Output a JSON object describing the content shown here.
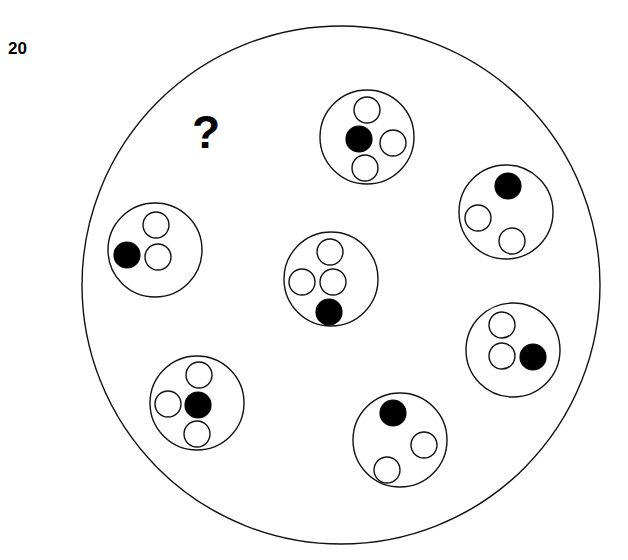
{
  "figure": {
    "item_number": "20",
    "query_symbol": "?",
    "background_color": "#ffffff",
    "stroke_color": "#111111",
    "filled_dot_color": "#000000",
    "open_dot_color": "#ffffff",
    "outer_boundary": {
      "cx": 341,
      "cy": 285,
      "r": 259
    },
    "item_number_position": {
      "x": 8,
      "y": 54
    },
    "query_position": {
      "x": 192,
      "y": 148
    },
    "group_radius": 47,
    "dot_radius": 13,
    "groups": [
      {
        "name": "top-group",
        "cx": 367,
        "cy": 137,
        "dot_count": 4,
        "filled_count": 1,
        "open_count": 3,
        "dots": [
          {
            "dx": 0,
            "dy": -27,
            "fill": "open"
          },
          {
            "dx": -8,
            "dy": 2,
            "fill": "filled"
          },
          {
            "dx": 26,
            "dy": 6,
            "fill": "open"
          },
          {
            "dx": -2,
            "dy": 31,
            "fill": "open"
          }
        ]
      },
      {
        "name": "upper-right-group",
        "cx": 506,
        "cy": 212,
        "dot_count": 3,
        "filled_count": 1,
        "open_count": 2,
        "dots": [
          {
            "dx": 2,
            "dy": -26,
            "fill": "filled"
          },
          {
            "dx": -28,
            "dy": 6,
            "fill": "open"
          },
          {
            "dx": 6,
            "dy": 29,
            "fill": "open"
          }
        ]
      },
      {
        "name": "right-group",
        "cx": 513,
        "cy": 350,
        "dot_count": 3,
        "filled_count": 1,
        "open_count": 2,
        "dots": [
          {
            "dx": -11,
            "dy": -25,
            "fill": "open"
          },
          {
            "dx": -11,
            "dy": 6,
            "fill": "open"
          },
          {
            "dx": 20,
            "dy": 7,
            "fill": "filled"
          }
        ]
      },
      {
        "name": "bottom-right-group",
        "cx": 400,
        "cy": 440,
        "dot_count": 3,
        "filled_count": 1,
        "open_count": 2,
        "dots": [
          {
            "dx": -7,
            "dy": -27,
            "fill": "filled"
          },
          {
            "dx": 24,
            "dy": 5,
            "fill": "open"
          },
          {
            "dx": -13,
            "dy": 30,
            "fill": "open"
          }
        ]
      },
      {
        "name": "bottom-left-group",
        "cx": 197,
        "cy": 403,
        "dot_count": 4,
        "filled_count": 1,
        "open_count": 3,
        "dots": [
          {
            "dx": 2,
            "dy": -28,
            "fill": "open"
          },
          {
            "dx": -29,
            "dy": 1,
            "fill": "open"
          },
          {
            "dx": 1,
            "dy": 2,
            "fill": "filled"
          },
          {
            "dx": 0,
            "dy": 31,
            "fill": "open"
          }
        ]
      },
      {
        "name": "left-group",
        "cx": 155,
        "cy": 250,
        "dot_count": 3,
        "filled_count": 1,
        "open_count": 2,
        "dots": [
          {
            "dx": 1,
            "dy": -25,
            "fill": "open"
          },
          {
            "dx": -28,
            "dy": 5,
            "fill": "filled"
          },
          {
            "dx": 3,
            "dy": 7,
            "fill": "open"
          }
        ]
      },
      {
        "name": "center-group",
        "cx": 331,
        "cy": 279,
        "dot_count": 4,
        "filled_count": 1,
        "open_count": 3,
        "dots": [
          {
            "dx": -1,
            "dy": -27,
            "fill": "open"
          },
          {
            "dx": -29,
            "dy": 3,
            "fill": "open"
          },
          {
            "dx": 2,
            "dy": 3,
            "fill": "open"
          },
          {
            "dx": -2,
            "dy": 33,
            "fill": "filled"
          }
        ]
      }
    ]
  }
}
